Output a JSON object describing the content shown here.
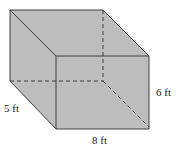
{
  "figure": {
    "shape": "rectangular prism",
    "colors": {
      "fill": "#bdbdbd",
      "edge": "#3e3e3e"
    },
    "dimensions": {
      "length": {
        "value": 8,
        "unit": "ft",
        "label": "8 ft"
      },
      "width": {
        "value": 5,
        "unit": "ft",
        "label": "5 ft"
      },
      "height": {
        "value": 6,
        "unit": "ft",
        "label": "6 ft"
      }
    }
  }
}
